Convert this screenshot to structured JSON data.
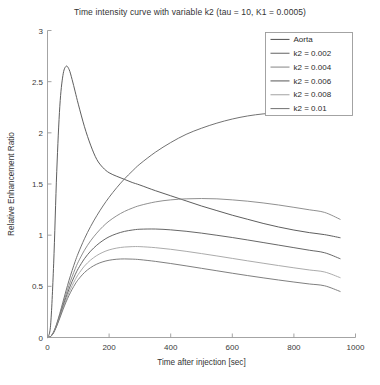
{
  "chart_data": {
    "type": "line",
    "title": "Time intensity curve with variable k2 (tau = 10, K1 = 0.0005)",
    "xlabel": "Time after injection [sec]",
    "ylabel": "Relative Enhancement Ratio",
    "xlim": [
      0,
      1000
    ],
    "ylim": [
      0,
      3
    ],
    "xticks": [
      0,
      200,
      400,
      600,
      800,
      1000
    ],
    "xtick_labels": [
      "0",
      "200",
      "400",
      "600",
      "800",
      "1000"
    ],
    "yticks": [
      0,
      0.5,
      1,
      1.5,
      2,
      2.5,
      3
    ],
    "ytick_labels": [
      "0",
      "0.5",
      "1",
      "1.5",
      "2",
      "2.5",
      "3"
    ],
    "grid": false,
    "legend_position": "upper right",
    "legend_entries": [
      "Aorta",
      "k2 = 0.002",
      "k2 = 0.004",
      "k2 = 0.006",
      "k2 = 0.008",
      "k2 = 0.01"
    ],
    "annotations": {
      "tau": "10",
      "K1": "0.0005"
    },
    "x": [
      0,
      10,
      20,
      30,
      40,
      50,
      60,
      70,
      80,
      90,
      100,
      120,
      140,
      160,
      180,
      200,
      225,
      250,
      275,
      300,
      350,
      400,
      450,
      500,
      550,
      600,
      650,
      700,
      750,
      800,
      850,
      900,
      950
    ],
    "series": [
      {
        "name": "Aorta",
        "color": "#555555",
        "values": [
          0,
          0.12,
          0.72,
          1.62,
          2.26,
          2.56,
          2.65,
          2.62,
          2.52,
          2.4,
          2.28,
          2.06,
          1.88,
          1.74,
          1.66,
          1.61,
          1.575,
          1.545,
          1.515,
          1.49,
          1.435,
          1.385,
          1.335,
          1.285,
          1.24,
          1.195,
          1.155,
          1.115,
          1.08,
          1.05,
          1.025,
          1.005,
          0.975
        ]
      },
      {
        "name": "k2 = 0.002",
        "color": "#6a6a6a",
        "values": [
          0,
          0.01,
          0.055,
          0.135,
          0.235,
          0.345,
          0.455,
          0.56,
          0.655,
          0.745,
          0.825,
          0.965,
          1.085,
          1.19,
          1.285,
          1.37,
          1.465,
          1.55,
          1.625,
          1.695,
          1.81,
          1.905,
          1.985,
          2.045,
          2.095,
          2.135,
          2.165,
          2.185,
          2.195,
          2.205,
          2.21,
          2.215,
          2.215
        ]
      },
      {
        "name": "k2 = 0.004",
        "color": "#8a8a8a",
        "values": [
          0,
          0.01,
          0.053,
          0.128,
          0.222,
          0.322,
          0.42,
          0.512,
          0.595,
          0.672,
          0.74,
          0.853,
          0.945,
          1.02,
          1.085,
          1.138,
          1.19,
          1.232,
          1.264,
          1.29,
          1.325,
          1.345,
          1.355,
          1.358,
          1.355,
          1.345,
          1.332,
          1.315,
          1.295,
          1.272,
          1.248,
          1.222,
          1.155
        ]
      },
      {
        "name": "k2 = 0.006",
        "color": "#5f5f5f",
        "values": [
          0,
          0.01,
          0.051,
          0.122,
          0.21,
          0.302,
          0.391,
          0.474,
          0.548,
          0.615,
          0.674,
          0.77,
          0.844,
          0.902,
          0.948,
          0.984,
          1.015,
          1.037,
          1.05,
          1.058,
          1.06,
          1.052,
          1.038,
          1.02,
          0.999,
          0.977,
          0.953,
          0.928,
          0.903,
          0.878,
          0.853,
          0.828,
          0.77
        ]
      },
      {
        "name": "k2 = 0.008",
        "color": "#a6a6a6",
        "values": [
          0,
          0.009,
          0.049,
          0.117,
          0.2,
          0.285,
          0.366,
          0.441,
          0.507,
          0.566,
          0.617,
          0.698,
          0.757,
          0.801,
          0.833,
          0.856,
          0.874,
          0.884,
          0.888,
          0.888,
          0.878,
          0.862,
          0.842,
          0.82,
          0.797,
          0.773,
          0.749,
          0.726,
          0.703,
          0.681,
          0.66,
          0.64,
          0.585
        ]
      },
      {
        "name": "k2 = 0.01",
        "color": "#787878",
        "values": [
          0,
          0.009,
          0.047,
          0.112,
          0.19,
          0.27,
          0.345,
          0.412,
          0.471,
          0.523,
          0.567,
          0.635,
          0.683,
          0.717,
          0.74,
          0.755,
          0.765,
          0.768,
          0.766,
          0.761,
          0.744,
          0.723,
          0.7,
          0.676,
          0.652,
          0.628,
          0.605,
          0.583,
          0.562,
          0.542,
          0.523,
          0.505,
          0.45
        ]
      }
    ]
  }
}
